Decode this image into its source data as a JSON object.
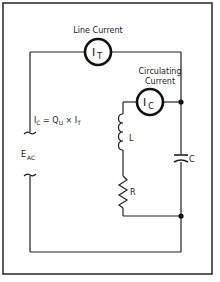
{
  "diagram": {
    "line_current": {
      "label": "Line Current",
      "meter_symbol": "I",
      "meter_subscript": "T"
    },
    "circulating_current": {
      "label_line1": "Circulating",
      "label_line2": "Current",
      "meter_symbol": "I",
      "meter_subscript": "C"
    },
    "equation": {
      "lhs_symbol": "I",
      "lhs_subscript": "C",
      "equals": " = ",
      "q_symbol": "Q",
      "q_subscript": "U",
      "times": " × ",
      "rhs_symbol": "I",
      "rhs_subscript": "T"
    },
    "source": {
      "symbol": "E",
      "subscript": "AC"
    },
    "components": {
      "inductor_label": "L",
      "resistor_label": "R",
      "capacitor_label": "C"
    },
    "colors": {
      "line": "#222222",
      "background": "#ffffff"
    }
  }
}
